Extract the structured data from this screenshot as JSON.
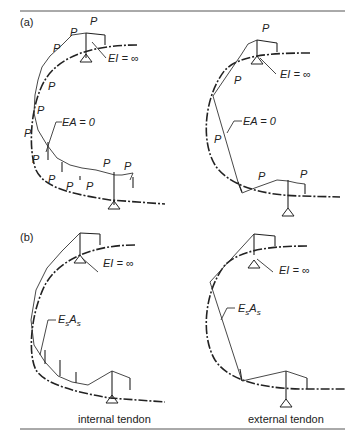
{
  "caption_fragment": "(...), ... diagram",
  "panels": {
    "a": {
      "label": "(a)",
      "load_symbol": "P",
      "rigid_label": "EI = ∞",
      "tendon_label": "EA = 0"
    },
    "b": {
      "label": "(b)",
      "rigid_label": "EI = ∞",
      "tendon_label": "EsAs"
    }
  },
  "columns": {
    "left": "internal tendon",
    "right": "external tendon"
  }
}
